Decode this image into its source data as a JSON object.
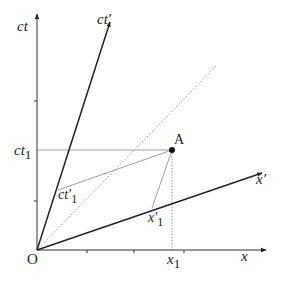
{
  "diagram": {
    "type": "minkowski-spacetime-diagram",
    "axes": {
      "ct": {
        "label": "ct"
      },
      "x": {
        "label": "x"
      },
      "ct_prime": {
        "label": "ct′"
      },
      "x_prime": {
        "label": "x′"
      },
      "light_line": {
        "style": "dotted"
      }
    },
    "origin": {
      "label": "O"
    },
    "event": {
      "label": "A"
    },
    "projections": {
      "ct1": {
        "label_main": "ct",
        "label_sub": "1"
      },
      "x1": {
        "label_main": "x",
        "label_sub": "1"
      },
      "ct1_prime": {
        "label_main": "ct′",
        "label_sub": "1"
      },
      "x1_prime": {
        "label_main": "x′",
        "label_sub": "1"
      }
    },
    "colors": {
      "axis": "#333333",
      "primed_axis": "#222222",
      "guide": "#888888",
      "dotted": "#999999",
      "point": "#111111"
    }
  }
}
